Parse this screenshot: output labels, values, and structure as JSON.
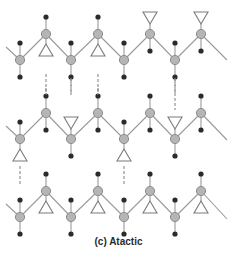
{
  "caption": "(c) Atactic",
  "colors": {
    "backbone": "#9a9a9a",
    "carbon_fill": "#b5b5b5",
    "carbon_stroke": "#8c8c8c",
    "hydrogen": "#2b2b2b",
    "side_group_stroke": "#7a7a7a",
    "dashed": "#8a8a8a"
  },
  "chains": [
    {
      "name": "chain-1",
      "low_y": 60,
      "high_y": 34,
      "start": [
        6,
        47
      ],
      "end": [
        227,
        60
      ],
      "low_x": [
        20,
        71,
        124,
        175
      ],
      "high_x": [
        46,
        98,
        150,
        201
      ],
      "high_groups": [
        "down",
        "down",
        "up",
        "up"
      ]
    },
    {
      "name": "chain-2",
      "low_y": 139,
      "high_y": 113,
      "start": [
        6,
        126
      ],
      "end": [
        227,
        140
      ],
      "low_x": [
        20,
        71,
        124,
        175
      ],
      "high_x": [
        46,
        98,
        150,
        201
      ],
      "low_groups": [
        "down",
        "up",
        "down",
        "up"
      ]
    },
    {
      "name": "chain-3",
      "low_y": 217,
      "high_y": 191,
      "start": [
        6,
        204
      ],
      "end": [
        227,
        219
      ],
      "low_x": [
        20,
        71,
        124,
        175
      ],
      "high_x": [
        46,
        98,
        150,
        201
      ],
      "high_groups": [
        "down",
        "down",
        "down",
        "down"
      ]
    }
  ]
}
